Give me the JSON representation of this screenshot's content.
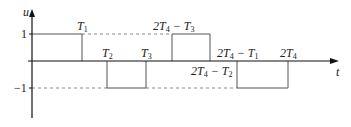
{
  "diagram": {
    "type": "piecewise-square-wave",
    "axes": {
      "x_label": "t",
      "y_label": "u",
      "y_ticks": [
        {
          "value": 1,
          "label": "1"
        },
        {
          "value": -1,
          "label": "−1"
        }
      ]
    },
    "time_labels": {
      "T1": {
        "base": "T",
        "sub": "1"
      },
      "T2": {
        "base": "T",
        "sub": "2"
      },
      "T3": {
        "base": "T",
        "sub": "3"
      },
      "t_2T4_minus_T3": {
        "pre": "2T",
        "sub": "4",
        "post": " − T",
        "sub2": "3"
      },
      "t_2T4_minus_T2": {
        "pre": "2T",
        "sub": "4",
        "post": " − T",
        "sub2": "2"
      },
      "t_2T4_minus_T1": {
        "pre": "2T",
        "sub": "4",
        "post": " − T",
        "sub2": "1"
      },
      "t_2T4": {
        "pre": "2T",
        "sub": "4"
      }
    },
    "segments": [
      {
        "from": "0",
        "to": "T1",
        "value": 1
      },
      {
        "from": "T1",
        "to": "T2",
        "value": 0
      },
      {
        "from": "T2",
        "to": "T3",
        "value": -1
      },
      {
        "from": "T3",
        "to": "2T4-T3",
        "value": 0
      },
      {
        "from": "2T4-T3",
        "to": "2T4-T2",
        "value": 1
      },
      {
        "from": "2T4-T2",
        "to": "2T4-T1",
        "value": 0
      },
      {
        "from": "2T4-T1",
        "to": "2T4",
        "value": -1
      }
    ],
    "colors": {
      "line": "#555555",
      "axis": "#111111",
      "dashed": "#777777"
    }
  }
}
